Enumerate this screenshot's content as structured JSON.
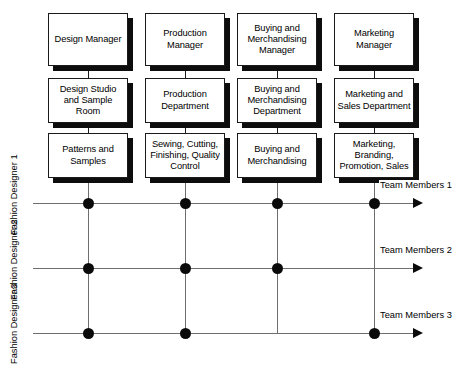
{
  "diagram": {
    "type": "matrix-organisation-chart",
    "columns": [
      {
        "id": "design",
        "manager": "Design Manager",
        "department": "Design Studio and Sample Room",
        "function": "Patterns and Samples"
      },
      {
        "id": "production",
        "manager": "Production Manager",
        "department": "Production Department",
        "function": "Sewing, Cutting, Finishing, Quality Control"
      },
      {
        "id": "buying",
        "manager": "Buying and Merchandising Manager",
        "department": "Buying and Merchandising Department",
        "function": "Buying and Merchandising"
      },
      {
        "id": "marketing",
        "manager": "Marketing Manager",
        "department": "Marketing and Sales Department",
        "function": "Marketing, Branding, Promotion, Sales"
      }
    ],
    "rows": [
      {
        "id": "fd1",
        "label": "Fashion Designer 1",
        "team": "Team Members 1"
      },
      {
        "id": "fd2",
        "label": "Fashion Designer 2",
        "team": "Team Members 2"
      },
      {
        "id": "fd3",
        "label": "Fashion Designer 3",
        "team": "Team Members 3"
      }
    ],
    "intersections": [
      {
        "row": "fd1",
        "columns": [
          "design",
          "production",
          "buying",
          "marketing"
        ]
      },
      {
        "row": "fd2",
        "columns": [
          "design",
          "production",
          "buying"
        ]
      },
      {
        "row": "fd3",
        "columns": [
          "design",
          "production",
          "marketing"
        ]
      }
    ],
    "colors": {
      "box_border": "#1a1a1a",
      "box_fill": "#ffffff",
      "box_shadow": "#0d0d0d",
      "grid_line": "#6e6e6e",
      "node_dot": "#0a0a0a",
      "text": "#000000"
    }
  }
}
